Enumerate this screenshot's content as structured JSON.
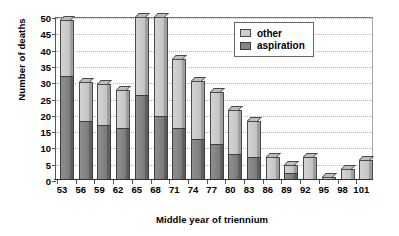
{
  "chart_data": {
    "type": "bar",
    "subtype": "stacked-3d-column",
    "title": "",
    "xlabel": "Middle year of triennium",
    "ylabel": "Number of deaths",
    "categories": [
      "53",
      "56",
      "59",
      "62",
      "65",
      "68",
      "71",
      "74",
      "77",
      "80",
      "83",
      "86",
      "89",
      "92",
      "95",
      "98",
      "101"
    ],
    "series": [
      {
        "name": "aspiration",
        "color": "#868686",
        "values": [
          32,
          18,
          17,
          16,
          26,
          19.5,
          16,
          12.5,
          11,
          8,
          7,
          0,
          2,
          0,
          0,
          0,
          0
        ]
      },
      {
        "name": "other",
        "color": "#cdcdcd",
        "values": [
          17,
          12,
          12.5,
          11.5,
          24,
          30.5,
          21,
          18,
          16,
          13.5,
          11,
          7,
          2.5,
          7,
          1,
          3.5,
          6
        ]
      }
    ],
    "totals": [
      49,
      30,
      29.5,
      27.5,
      50,
      50,
      37,
      30.5,
      27,
      21.5,
      18,
      7,
      4.5,
      7,
      1,
      3.5,
      6
    ],
    "ylim": [
      0,
      50
    ],
    "yticks": [
      0,
      5,
      10,
      15,
      20,
      25,
      30,
      35,
      40,
      45,
      50
    ],
    "grid": true,
    "grid_style": "dotted-horizontal",
    "legend_position": "top-right",
    "legend_entries": [
      "other",
      "aspiration"
    ]
  },
  "axes": {
    "y_title": "Number of deaths",
    "x_title": "Middle year of triennium"
  }
}
